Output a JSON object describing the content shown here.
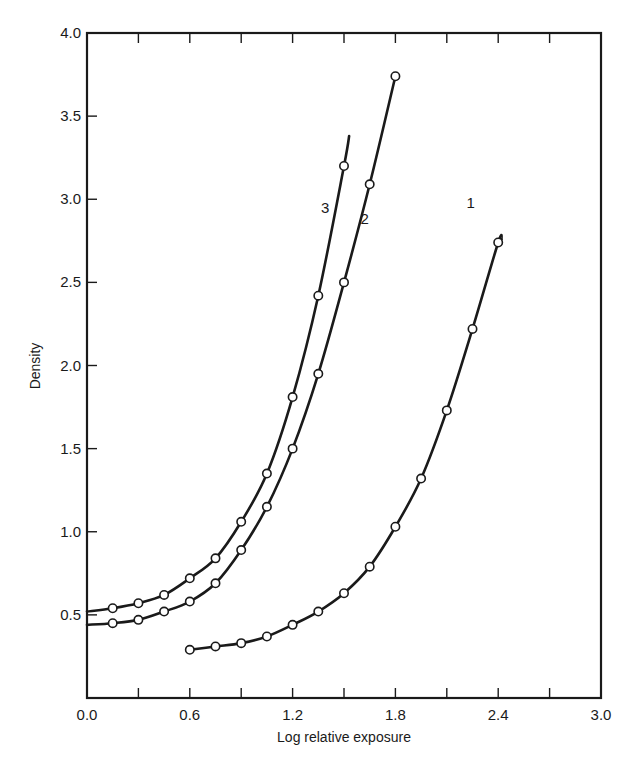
{
  "chart_data": {
    "type": "line",
    "title": "",
    "xlabel": "Log relative exposure",
    "ylabel": "Density",
    "xlim": [
      0.0,
      3.0
    ],
    "ylim": [
      0.0,
      4.0
    ],
    "grid": false,
    "legend": "inline curve labels",
    "x_ticks": [
      "0.0",
      "0.6",
      "1.2",
      "1.8",
      "2.4",
      "3.0"
    ],
    "x_minor_step": 0.3,
    "y_ticks": [
      "0.5",
      "1.0",
      "1.5",
      "2.0",
      "2.5",
      "3.0",
      "3.5",
      "4.0"
    ],
    "series": [
      {
        "name": "1",
        "label_pos": [
          2.24,
          2.95
        ],
        "line_start": [
          0.6,
          0.29
        ],
        "line_end": [
          2.42,
          2.76
        ],
        "points": [
          [
            0.6,
            0.29
          ],
          [
            0.75,
            0.31
          ],
          [
            0.9,
            0.33
          ],
          [
            1.05,
            0.37
          ],
          [
            1.2,
            0.44
          ],
          [
            1.35,
            0.52
          ],
          [
            1.5,
            0.63
          ],
          [
            1.65,
            0.79
          ],
          [
            1.8,
            1.03
          ],
          [
            1.95,
            1.32
          ],
          [
            2.1,
            1.73
          ],
          [
            2.25,
            2.22
          ],
          [
            2.4,
            2.74
          ]
        ]
      },
      {
        "name": "2",
        "label_pos": [
          1.62,
          2.85
        ],
        "line_start": [
          0.0,
          0.44
        ],
        "line_end": [
          1.8,
          3.74
        ],
        "points": [
          [
            0.15,
            0.45
          ],
          [
            0.3,
            0.47
          ],
          [
            0.45,
            0.52
          ],
          [
            0.6,
            0.58
          ],
          [
            0.75,
            0.69
          ],
          [
            0.9,
            0.89
          ],
          [
            1.05,
            1.15
          ],
          [
            1.2,
            1.5
          ],
          [
            1.35,
            1.95
          ],
          [
            1.5,
            2.5
          ],
          [
            1.65,
            3.09
          ],
          [
            1.8,
            3.74
          ]
        ]
      },
      {
        "name": "3",
        "label_pos": [
          1.39,
          2.92
        ],
        "line_start": [
          0.0,
          0.52
        ],
        "line_end": [
          1.53,
          3.38
        ],
        "points": [
          [
            0.15,
            0.54
          ],
          [
            0.3,
            0.57
          ],
          [
            0.45,
            0.62
          ],
          [
            0.6,
            0.72
          ],
          [
            0.75,
            0.84
          ],
          [
            0.9,
            1.06
          ],
          [
            1.05,
            1.35
          ],
          [
            1.2,
            1.81
          ],
          [
            1.35,
            2.42
          ],
          [
            1.5,
            3.2
          ]
        ]
      }
    ]
  },
  "colors": {
    "ink": "#1a1a1a",
    "background": "#ffffff",
    "marker_fill": "#ffffff"
  }
}
